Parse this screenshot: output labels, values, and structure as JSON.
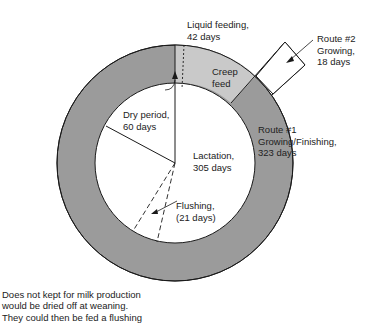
{
  "diagram": {
    "colors": {
      "ring_dark": "#9b9b9b",
      "ring_light": "#c9c9c9",
      "inner": "#ffffff",
      "stroke": "#1a1a1a"
    },
    "segments": [
      {
        "name": "lactation",
        "label_line1": "Lactation,",
        "label_line2": "305 days"
      },
      {
        "name": "dry-period",
        "label_line1": "Dry period,",
        "label_line2": "60 days"
      },
      {
        "name": "flushing",
        "label_line1": "Flushing,",
        "label_line2": "(21 days)"
      },
      {
        "name": "liquid-feeding",
        "label_line1": "Liquid feeding,",
        "label_line2": "42 days"
      },
      {
        "name": "creep-feed",
        "label_line1": "Creep",
        "label_line2": "feed"
      },
      {
        "name": "route-1",
        "label_line1": "Route #1",
        "label_line2": "Growing/Finishing,",
        "label_line3": "323 days"
      },
      {
        "name": "route-2",
        "label_line1": "Route #2",
        "label_line2": "Growing,",
        "label_line3": "18 days"
      }
    ],
    "note": {
      "line1": "Does not kept for milk production",
      "line2": "would be dried off at weaning.",
      "line3": "They could then be fed a flushing"
    }
  }
}
